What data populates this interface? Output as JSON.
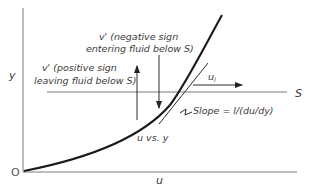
{
  "diagram": {
    "axes": {
      "y_label": "y",
      "x_label": "u",
      "origin_label": "O"
    },
    "reference_line": {
      "label": "S"
    },
    "curve": {
      "label": "u vs. y"
    },
    "velocity_arrow": {
      "label": "u",
      "subscript": "l"
    },
    "annotations": {
      "negative_line1": "v' (negative sign",
      "negative_line2": "entering fluid below S)",
      "positive_line1": "v' (positive sign",
      "positive_line2": "leaving fluid below S)",
      "slope": "Slope = l/(du/dy)"
    }
  }
}
